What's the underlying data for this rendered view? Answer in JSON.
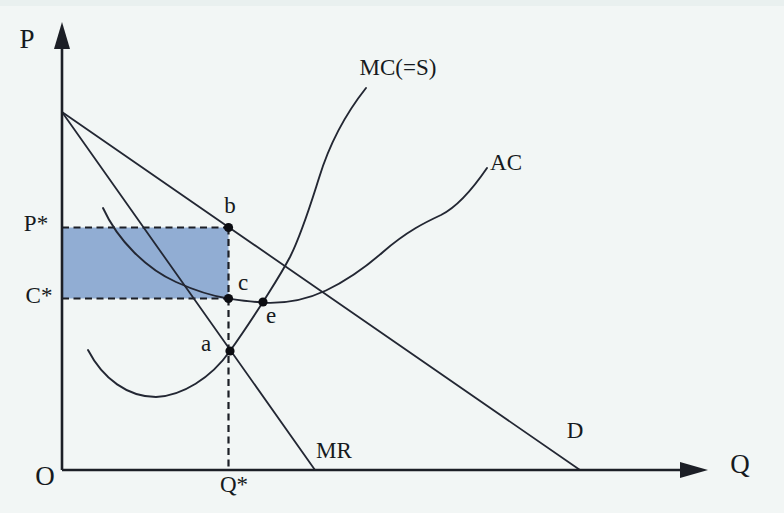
{
  "figure": {
    "type": "curve-diagram",
    "background": "#f2f6f5",
    "ink": "#232733",
    "shade_color": "#91add3",
    "width": 784,
    "height": 513,
    "axes": {
      "y_axis": {
        "x": 62,
        "y_top": 46,
        "y_bottom": 470,
        "arrow_points": "62,22 54,49 70,49"
      },
      "x_axis": {
        "y": 470,
        "x_left": 62,
        "x_right": 682,
        "arrow_points": "708,470 680,462 680,478"
      }
    },
    "shaded_rect": {
      "x": 62,
      "y": 227.5,
      "w": 166.5,
      "h": 71
    },
    "dashed_segments": [
      {
        "name": "p-star-guide",
        "x1": 62,
        "y1": 227.5,
        "x2": 228.5,
        "y2": 227.5
      },
      {
        "name": "c-star-guide",
        "x1": 62,
        "y1": 298.5,
        "x2": 228.5,
        "y2": 298.5
      },
      {
        "name": "rect-right-edge",
        "x1": 228.5,
        "y1": 227.5,
        "x2": 228.5,
        "y2": 298.5
      },
      {
        "name": "q-star-guide",
        "x1": 228.5,
        "y1": 298.5,
        "x2": 228.5,
        "y2": 469
      }
    ],
    "lines": [
      {
        "name": "demand-curve",
        "x1": 62,
        "y1": 112,
        "x2": 580,
        "y2": 470
      },
      {
        "name": "marginal-revenue-curve",
        "x1": 62,
        "y1": 112,
        "x2": 315,
        "y2": 470
      }
    ],
    "curves": [
      {
        "name": "marginal-cost-curve",
        "path": "M 88 350 C 103 379 128 397 156 397 C 182 396 211 378 230 351 C 243 333 252 319 263 302 C 273 286 281 274 290 257 C 302 233 311 203 319 178 C 330 142 347 112 366 88"
      },
      {
        "name": "average-cost-curve",
        "path": "M 103 208 C 118 241 147 269 176 282 C 196 291 212 296 228 298.5 C 242 300.5 252 302 266 302.8 C 288 303.5 309 298.5 326 290.5 C 349 279.5 367 266 383 252 C 407 231 426 222 441 215 C 457 207 472 190 487 168"
      }
    ],
    "points": [
      {
        "name": "point-b",
        "x": 228.5,
        "y": 227.5
      },
      {
        "name": "point-c",
        "x": 228.5,
        "y": 298.5
      },
      {
        "name": "point-e",
        "x": 263,
        "y": 302
      },
      {
        "name": "point-a",
        "x": 230,
        "y": 351
      }
    ],
    "texts": [
      {
        "id": "p-axis-label",
        "t": "P",
        "x": 27,
        "y": 42,
        "cls": "big"
      },
      {
        "id": "q-axis-label",
        "t": "Q",
        "x": 740,
        "y": 467,
        "cls": "big"
      },
      {
        "id": "origin-label",
        "t": "O",
        "x": 45,
        "y": 479,
        "cls": "big"
      },
      {
        "id": "p-star-label",
        "t": "P*",
        "x": 36,
        "y": 226,
        "cls": "mid"
      },
      {
        "id": "c-star-label",
        "t": "C*",
        "x": 39,
        "y": 298,
        "cls": "mid"
      },
      {
        "id": "q-star-label",
        "t": "Q*",
        "x": 234,
        "y": 487,
        "cls": "mid"
      },
      {
        "id": "mc-label",
        "t": "MC(=S)",
        "x": 398,
        "y": 70,
        "cls": "mid"
      },
      {
        "id": "ac-label",
        "t": "AC",
        "x": 506,
        "y": 165,
        "cls": "mid"
      },
      {
        "id": "d-label",
        "t": "D",
        "x": 575,
        "y": 433,
        "cls": "mid"
      },
      {
        "id": "mr-label",
        "t": "MR",
        "x": 334,
        "y": 453,
        "cls": "mid"
      },
      {
        "id": "point-b-label",
        "t": "b",
        "x": 230,
        "y": 208,
        "cls": "mid"
      },
      {
        "id": "point-c-label",
        "t": "c",
        "x": 243,
        "y": 285,
        "cls": "mid"
      },
      {
        "id": "point-e-label",
        "t": "e",
        "x": 271,
        "y": 318,
        "cls": "mid"
      },
      {
        "id": "point-a-label",
        "t": "a",
        "x": 206,
        "y": 346,
        "cls": "mid"
      }
    ]
  }
}
